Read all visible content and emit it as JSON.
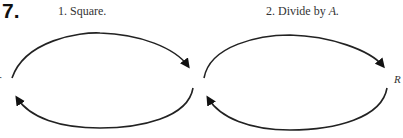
{
  "problem": {
    "number": "7.",
    "steps": [
      {
        "label": "1. Square."
      },
      {
        "label": "2. Divide by ",
        "var": "A."
      }
    ],
    "labels": {
      "left": "r",
      "right": "R"
    }
  }
}
